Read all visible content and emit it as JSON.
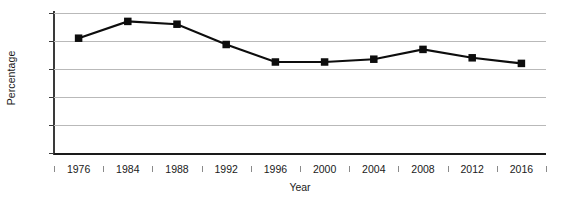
{
  "chart_data": {
    "type": "line",
    "title": "",
    "xlabel": "Year",
    "ylabel": "Percentage",
    "categories": [
      "1976",
      "1984",
      "1988",
      "1992",
      "1996",
      "2000",
      "2004",
      "2008",
      "2012",
      "2016"
    ],
    "values": [
      82,
      94,
      92,
      77.5,
      65,
      65,
      67,
      74,
      68,
      64
    ],
    "series": [
      {
        "name": "Percentage",
        "values": [
          82,
          94,
          92,
          77.5,
          65,
          65,
          67,
          74,
          68,
          64
        ]
      }
    ],
    "ylim": [
      0,
      100
    ],
    "y_ticks": [
      "0",
      "20",
      "40",
      "60",
      "80",
      "100"
    ],
    "y_tick_values": [
      0,
      20,
      40,
      60,
      80,
      100
    ],
    "grid": "horizontal",
    "legend": "none",
    "marker": "square",
    "line_color": "#0d0d0d",
    "marker_color": "#0d0d0d",
    "grid_color": "#b9b9b9",
    "axis_color": "#3a3a3a",
    "background": "#ffffff"
  }
}
